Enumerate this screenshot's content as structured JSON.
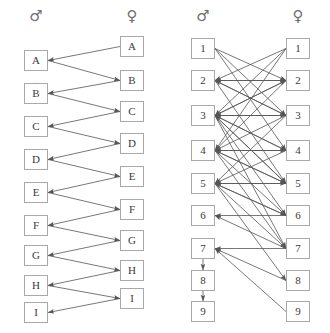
{
  "figure": {
    "title": "",
    "background": "#ffffff",
    "node_border_color": "#a9a9a9",
    "edge_color": "#555555",
    "symbol_color": "#6e6e6e"
  },
  "panels": [
    {
      "id": "left-panel",
      "male_symbol": "♂",
      "female_symbol": "♀",
      "male_column": {
        "label": "male",
        "nodes": [
          {
            "id": "mA",
            "label": "A",
            "x": 24,
            "y": 50
          },
          {
            "id": "mB",
            "label": "B",
            "x": 24,
            "y": 83
          },
          {
            "id": "mC",
            "label": "C",
            "x": 24,
            "y": 116
          },
          {
            "id": "mD",
            "label": "D",
            "x": 24,
            "y": 149
          },
          {
            "id": "mE",
            "label": "E",
            "x": 24,
            "y": 182
          },
          {
            "id": "mF",
            "label": "F",
            "x": 24,
            "y": 215
          },
          {
            "id": "mG",
            "label": "G",
            "x": 24,
            "y": 245
          },
          {
            "id": "mH",
            "label": "H",
            "x": 24,
            "y": 275
          },
          {
            "id": "mI",
            "label": "I",
            "x": 24,
            "y": 302
          }
        ]
      },
      "female_column": {
        "label": "female",
        "nodes": [
          {
            "id": "fA",
            "label": "A",
            "x": 120,
            "y": 36
          },
          {
            "id": "fB",
            "label": "B",
            "x": 120,
            "y": 70
          },
          {
            "id": "fC",
            "label": "C",
            "x": 120,
            "y": 101
          },
          {
            "id": "fD",
            "label": "D",
            "x": 120,
            "y": 133
          },
          {
            "id": "fE",
            "label": "E",
            "x": 120,
            "y": 166
          },
          {
            "id": "fF",
            "label": "F",
            "x": 120,
            "y": 199
          },
          {
            "id": "fG",
            "label": "G",
            "x": 120,
            "y": 230
          },
          {
            "id": "fH",
            "label": "H",
            "x": 120,
            "y": 260
          },
          {
            "id": "fI",
            "label": "I",
            "x": 120,
            "y": 288
          }
        ]
      },
      "edges": [
        {
          "from": "fA",
          "to": "mA"
        },
        {
          "from": "mA",
          "to": "fB"
        },
        {
          "from": "fB",
          "to": "mB"
        },
        {
          "from": "mB",
          "to": "fC"
        },
        {
          "from": "fC",
          "to": "mC"
        },
        {
          "from": "mC",
          "to": "fD"
        },
        {
          "from": "fD",
          "to": "mD"
        },
        {
          "from": "mD",
          "to": "fE"
        },
        {
          "from": "fE",
          "to": "mE"
        },
        {
          "from": "mE",
          "to": "fF"
        },
        {
          "from": "fF",
          "to": "mF"
        },
        {
          "from": "mF",
          "to": "fG"
        },
        {
          "from": "fG",
          "to": "mG"
        },
        {
          "from": "mG",
          "to": "fH"
        },
        {
          "from": "fH",
          "to": "mH"
        },
        {
          "from": "mH",
          "to": "fI"
        },
        {
          "from": "fI",
          "to": "mI"
        }
      ]
    },
    {
      "id": "right-panel",
      "male_symbol": "♂",
      "female_symbol": "♀",
      "male_column": {
        "label": "male",
        "nodes": [
          {
            "id": "m1",
            "label": "1",
            "x": 26,
            "y": 38
          },
          {
            "id": "m2",
            "label": "2",
            "x": 26,
            "y": 70
          },
          {
            "id": "m3",
            "label": "3",
            "x": 26,
            "y": 105
          },
          {
            "id": "m4",
            "label": "4",
            "x": 26,
            "y": 140
          },
          {
            "id": "m5",
            "label": "5",
            "x": 26,
            "y": 173
          },
          {
            "id": "m6",
            "label": "6",
            "x": 26,
            "y": 205
          },
          {
            "id": "m7",
            "label": "7",
            "x": 26,
            "y": 238
          },
          {
            "id": "m8",
            "label": "8",
            "x": 26,
            "y": 270
          },
          {
            "id": "m9",
            "label": "9",
            "x": 26,
            "y": 301
          }
        ]
      },
      "female_column": {
        "label": "female",
        "nodes": [
          {
            "id": "f1",
            "label": "1",
            "x": 121,
            "y": 38
          },
          {
            "id": "f2",
            "label": "2",
            "x": 121,
            "y": 70
          },
          {
            "id": "f3",
            "label": "3",
            "x": 121,
            "y": 105
          },
          {
            "id": "f4",
            "label": "4",
            "x": 121,
            "y": 140
          },
          {
            "id": "f5",
            "label": "5",
            "x": 121,
            "y": 173
          },
          {
            "id": "f6",
            "label": "6",
            "x": 121,
            "y": 205
          },
          {
            "id": "f7",
            "label": "7",
            "x": 121,
            "y": 238
          },
          {
            "id": "f8",
            "label": "8",
            "x": 121,
            "y": 270
          },
          {
            "id": "f9",
            "label": "9",
            "x": 121,
            "y": 301
          }
        ]
      },
      "edges": [
        {
          "from": "m1",
          "to": "f2"
        },
        {
          "from": "m1",
          "to": "f3"
        },
        {
          "from": "m1",
          "to": "f4"
        },
        {
          "from": "f1",
          "to": "m2"
        },
        {
          "from": "f1",
          "to": "m3"
        },
        {
          "from": "f1",
          "to": "m4"
        },
        {
          "from": "m2",
          "to": "f2"
        },
        {
          "from": "m2",
          "to": "f3"
        },
        {
          "from": "m2",
          "to": "f5"
        },
        {
          "from": "f2",
          "to": "m2"
        },
        {
          "from": "f2",
          "to": "m3"
        },
        {
          "from": "f2",
          "to": "m4"
        },
        {
          "from": "m3",
          "to": "f2"
        },
        {
          "from": "m3",
          "to": "f3"
        },
        {
          "from": "m3",
          "to": "f4"
        },
        {
          "from": "m3",
          "to": "f5"
        },
        {
          "from": "m3",
          "to": "f6"
        },
        {
          "from": "m3",
          "to": "f7"
        },
        {
          "from": "f3",
          "to": "m2"
        },
        {
          "from": "f3",
          "to": "m3"
        },
        {
          "from": "f3",
          "to": "m4"
        },
        {
          "from": "f3",
          "to": "m5"
        },
        {
          "from": "m4",
          "to": "f4"
        },
        {
          "from": "m4",
          "to": "f5"
        },
        {
          "from": "m4",
          "to": "f6"
        },
        {
          "from": "m4",
          "to": "f7"
        },
        {
          "from": "f4",
          "to": "m3"
        },
        {
          "from": "f4",
          "to": "m4"
        },
        {
          "from": "f4",
          "to": "m5"
        },
        {
          "from": "m5",
          "to": "f5"
        },
        {
          "from": "m5",
          "to": "f6"
        },
        {
          "from": "m5",
          "to": "f7"
        },
        {
          "from": "m5",
          "to": "f8"
        },
        {
          "from": "f5",
          "to": "m3"
        },
        {
          "from": "f5",
          "to": "m4"
        },
        {
          "from": "f5",
          "to": "m5"
        },
        {
          "from": "f6",
          "to": "m5"
        },
        {
          "from": "f6",
          "to": "m6"
        },
        {
          "from": "f7",
          "to": "m6"
        },
        {
          "from": "f7",
          "to": "m7"
        },
        {
          "from": "f8",
          "to": "m7"
        },
        {
          "from": "f9",
          "to": "m7"
        },
        {
          "from": "m7",
          "to": "m8"
        },
        {
          "from": "m8",
          "to": "m9"
        }
      ]
    }
  ]
}
